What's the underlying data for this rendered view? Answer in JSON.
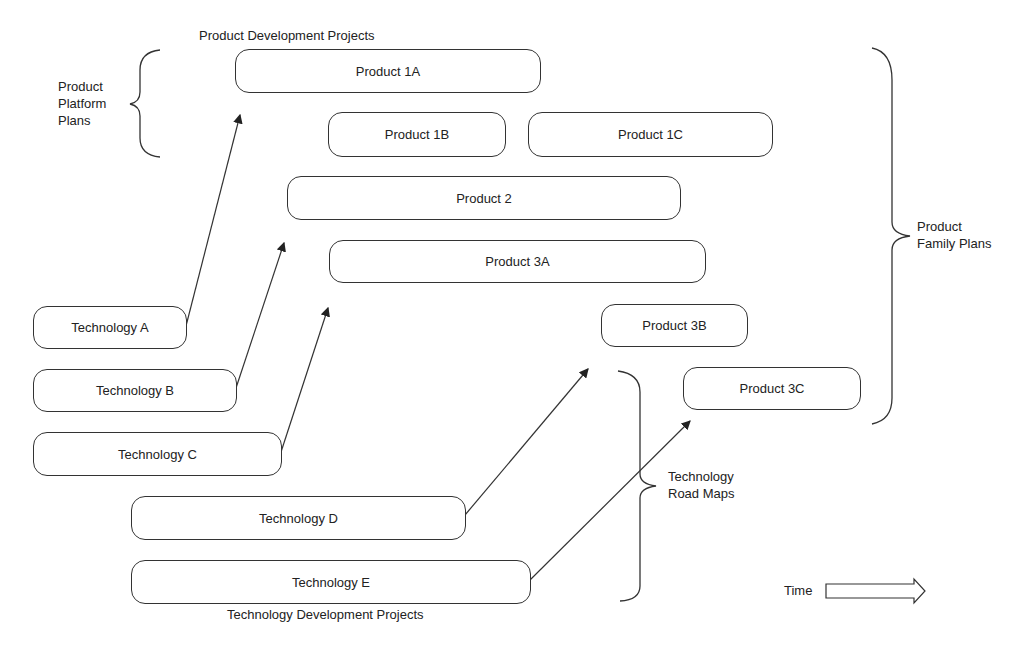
{
  "title_top": "Product Development Projects",
  "title_bottom": "Technology Development Projects",
  "brackets": {
    "product_platform_plans": [
      "Product",
      "Platform",
      "Plans"
    ],
    "product_family_plans": [
      "Product",
      "Family Plans"
    ],
    "technology_road_maps": [
      "Technology",
      "Road Maps"
    ]
  },
  "products": [
    {
      "id": "1A",
      "label": "Product 1A"
    },
    {
      "id": "1B",
      "label": "Product 1B"
    },
    {
      "id": "1C",
      "label": "Product 1C"
    },
    {
      "id": "2",
      "label": "Product 2"
    },
    {
      "id": "3A",
      "label": "Product 3A"
    },
    {
      "id": "3B",
      "label": "Product 3B"
    },
    {
      "id": "3C",
      "label": "Product 3C"
    }
  ],
  "technologies": [
    {
      "id": "A",
      "label": "Technology A"
    },
    {
      "id": "B",
      "label": "Technology B"
    },
    {
      "id": "C",
      "label": "Technology C"
    },
    {
      "id": "D",
      "label": "Technology D"
    },
    {
      "id": "E",
      "label": "Technology E"
    }
  ],
  "time_label": "Time"
}
